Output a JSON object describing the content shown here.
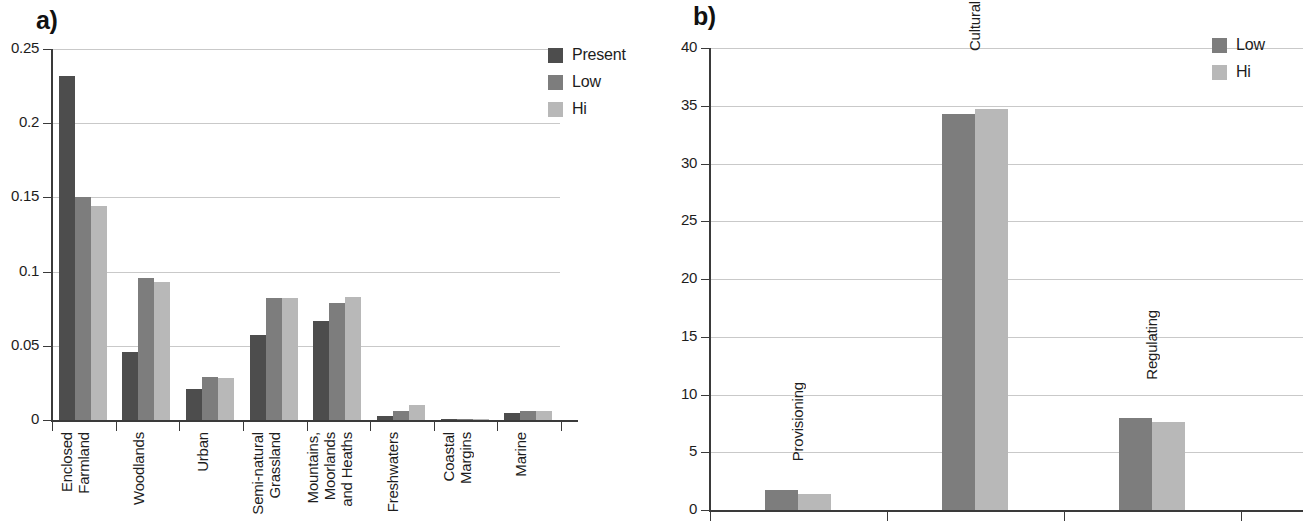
{
  "figure": {
    "panels": [
      {
        "letter": "a)"
      },
      {
        "letter": "b)"
      }
    ]
  },
  "colors": {
    "present": "#4d4d4d",
    "low": "#7d7d7d",
    "hi": "#b8b8b8",
    "axis": "#3a3a3a",
    "gridline": "#c9c9c9",
    "text": "#1d1d1d",
    "background": "#ffffff"
  },
  "panel_a": {
    "letter": "a)",
    "legend": [
      {
        "label": "Present",
        "color": "#4d4d4d"
      },
      {
        "label": "Low",
        "color": "#7d7d7d"
      },
      {
        "label": "Hi",
        "color": "#b8b8b8"
      }
    ],
    "y_ticks": [
      "0.25",
      "0.2",
      "0.15",
      "0.1",
      "0.05",
      "0"
    ],
    "x_labels": [
      "Enclosed\nFarmland",
      "Woodlands",
      "Urban",
      "Semi-natural\nGrassland",
      "Mountains,\nMoorlands\nand Heaths",
      "Freshwaters",
      "Coastal\nMargins",
      "Marine"
    ]
  },
  "panel_b": {
    "letter": "b)",
    "legend": [
      {
        "label": "Low",
        "color": "#7d7d7d"
      },
      {
        "label": "Hi",
        "color": "#b8b8b8"
      }
    ],
    "y_ticks": [
      "40",
      "35",
      "30",
      "25",
      "20",
      "15",
      "10",
      "5",
      "0"
    ],
    "x_labels": [
      "Provisioning",
      "Cultural",
      "Regulating"
    ]
  },
  "chart_data": [
    {
      "type": "bar",
      "panel": "a",
      "title": "",
      "xlabel": "",
      "ylabel": "",
      "ylim": [
        0,
        0.25
      ],
      "yticks": [
        0,
        0.05,
        0.1,
        0.15,
        0.2,
        0.25
      ],
      "grid": true,
      "legend_position": "top-right",
      "categories": [
        "Enclosed Farmland",
        "Woodlands",
        "Urban",
        "Semi-natural Grassland",
        "Mountains, Moorlands and Heaths",
        "Freshwaters",
        "Coastal Margins",
        "Marine"
      ],
      "series": [
        {
          "name": "Present",
          "color": "#4d4d4d",
          "values": [
            0.232,
            0.046,
            0.021,
            0.057,
            0.067,
            0.003,
            0.001,
            0.005
          ]
        },
        {
          "name": "Low",
          "color": "#7d7d7d",
          "values": [
            0.15,
            0.096,
            0.029,
            0.082,
            0.079,
            0.006,
            0.001,
            0.006
          ]
        },
        {
          "name": "Hi",
          "color": "#b8b8b8",
          "values": [
            0.144,
            0.093,
            0.028,
            0.082,
            0.083,
            0.01,
            0.001,
            0.006
          ]
        }
      ]
    },
    {
      "type": "bar",
      "panel": "b",
      "title": "",
      "xlabel": "",
      "ylabel": "",
      "ylim": [
        0,
        40
      ],
      "yticks": [
        0,
        5,
        10,
        15,
        20,
        25,
        30,
        35,
        40
      ],
      "grid": true,
      "legend_position": "top-right",
      "categories": [
        "Provisioning",
        "Cultural",
        "Regulating"
      ],
      "series": [
        {
          "name": "Low",
          "color": "#7d7d7d",
          "values": [
            1.7,
            34.3,
            8.0
          ]
        },
        {
          "name": "Hi",
          "color": "#b8b8b8",
          "values": [
            1.4,
            34.7,
            7.6
          ]
        }
      ]
    }
  ]
}
